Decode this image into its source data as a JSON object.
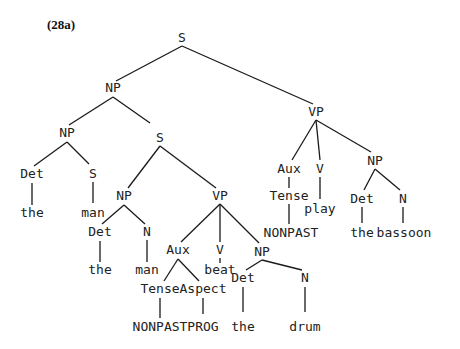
{
  "example_number": "(28a)",
  "tree": {
    "nodes": [
      {
        "id": "s_root",
        "label": "S",
        "x": 182,
        "y": 38
      },
      {
        "id": "np_subj",
        "label": "NP",
        "x": 113,
        "y": 88
      },
      {
        "id": "np_inner",
        "label": "NP",
        "x": 67,
        "y": 133
      },
      {
        "id": "det_1",
        "label": "Det",
        "x": 32,
        "y": 174
      },
      {
        "id": "s_rel_empty",
        "label": "S",
        "x": 93,
        "y": 174
      },
      {
        "id": "word_the_1",
        "label": "the",
        "x": 32,
        "y": 213
      },
      {
        "id": "word_man_1",
        "label": "man",
        "x": 93,
        "y": 213
      },
      {
        "id": "s_rel",
        "label": "S",
        "x": 160,
        "y": 138
      },
      {
        "id": "np_rel",
        "label": "NP",
        "x": 124,
        "y": 196
      },
      {
        "id": "det_2",
        "label": "Det",
        "x": 100,
        "y": 232
      },
      {
        "id": "n_2",
        "label": "N",
        "x": 147,
        "y": 232
      },
      {
        "id": "word_the_2",
        "label": "the",
        "x": 100,
        "y": 270
      },
      {
        "id": "word_man_2",
        "label": "man",
        "x": 147,
        "y": 270
      },
      {
        "id": "vp_rel",
        "label": "VP",
        "x": 220,
        "y": 196
      },
      {
        "id": "aux_rel",
        "label": "Aux",
        "x": 178,
        "y": 250
      },
      {
        "id": "v_rel",
        "label": "V",
        "x": 220,
        "y": 250
      },
      {
        "id": "np_obj_rel",
        "label": "NP",
        "x": 262,
        "y": 252
      },
      {
        "id": "tense_rel",
        "label": "Tense",
        "x": 160,
        "y": 289
      },
      {
        "id": "aspect_rel",
        "label": "Aspect",
        "x": 203,
        "y": 289
      },
      {
        "id": "word_beat",
        "label": "beat",
        "x": 220,
        "y": 270
      },
      {
        "id": "word_nonpast_rel",
        "label": "NONPAST",
        "x": 160,
        "y": 327
      },
      {
        "id": "word_prog",
        "label": "PROG",
        "x": 203,
        "y": 327
      },
      {
        "id": "det_3",
        "label": "Det",
        "x": 243,
        "y": 278
      },
      {
        "id": "n_3",
        "label": "N",
        "x": 305,
        "y": 278
      },
      {
        "id": "word_the_3",
        "label": "the",
        "x": 243,
        "y": 327
      },
      {
        "id": "word_drum",
        "label": "drum",
        "x": 305,
        "y": 327
      },
      {
        "id": "vp_main",
        "label": "VP",
        "x": 316,
        "y": 112
      },
      {
        "id": "aux_main",
        "label": "Aux",
        "x": 289,
        "y": 169
      },
      {
        "id": "v_main",
        "label": "V",
        "x": 320,
        "y": 169
      },
      {
        "id": "np_obj_main",
        "label": "NP",
        "x": 375,
        "y": 161
      },
      {
        "id": "tense_main",
        "label": "Tense",
        "x": 289,
        "y": 196
      },
      {
        "id": "word_play",
        "label": "play",
        "x": 320,
        "y": 209
      },
      {
        "id": "word_nonpast_main",
        "label": "NONPAST",
        "x": 291,
        "y": 233
      },
      {
        "id": "det_4",
        "label": "Det",
        "x": 362,
        "y": 199
      },
      {
        "id": "n_4",
        "label": "N",
        "x": 403,
        "y": 199
      },
      {
        "id": "word_the_4",
        "label": "the",
        "x": 362,
        "y": 233
      },
      {
        "id": "word_bassoon",
        "label": "bassoon",
        "x": 404,
        "y": 233
      }
    ],
    "edges": [
      {
        "from": [
          182,
          46
        ],
        "to": [
          116,
          81
        ]
      },
      {
        "from": [
          182,
          46
        ],
        "to": [
          313,
          104
        ]
      },
      {
        "from": [
          113,
          97
        ],
        "to": [
          69,
          125
        ]
      },
      {
        "from": [
          113,
          97
        ],
        "to": [
          150,
          123
        ]
      },
      {
        "from": [
          67,
          142
        ],
        "to": [
          34,
          166
        ]
      },
      {
        "from": [
          67,
          142
        ],
        "to": [
          89,
          164
        ]
      },
      {
        "from": [
          32,
          183
        ],
        "to": [
          32,
          205
        ]
      },
      {
        "from": [
          93,
          182
        ],
        "to": [
          93,
          203
        ]
      },
      {
        "from": [
          160,
          146
        ],
        "to": [
          128,
          188
        ]
      },
      {
        "from": [
          160,
          146
        ],
        "to": [
          216,
          188
        ]
      },
      {
        "from": [
          124,
          205
        ],
        "to": [
          102,
          224
        ]
      },
      {
        "from": [
          124,
          205
        ],
        "to": [
          145,
          224
        ]
      },
      {
        "from": [
          100,
          241
        ],
        "to": [
          100,
          262
        ]
      },
      {
        "from": [
          147,
          240
        ],
        "to": [
          147,
          262
        ]
      },
      {
        "from": [
          220,
          204
        ],
        "to": [
          181,
          242
        ]
      },
      {
        "from": [
          220,
          204
        ],
        "to": [
          220,
          242
        ]
      },
      {
        "from": [
          220,
          204
        ],
        "to": [
          259,
          243
        ]
      },
      {
        "from": [
          220,
          258
        ],
        "to": [
          220,
          263
        ]
      },
      {
        "from": [
          178,
          259
        ],
        "to": [
          164,
          281
        ]
      },
      {
        "from": [
          178,
          259
        ],
        "to": [
          199,
          281
        ]
      },
      {
        "from": [
          160,
          298
        ],
        "to": [
          160,
          318
        ]
      },
      {
        "from": [
          203,
          298
        ],
        "to": [
          203,
          314
        ]
      },
      {
        "from": [
          262,
          260
        ],
        "to": [
          246,
          270
        ]
      },
      {
        "from": [
          262,
          260
        ],
        "to": [
          302,
          270
        ]
      },
      {
        "from": [
          243,
          287
        ],
        "to": [
          243,
          312
        ]
      },
      {
        "from": [
          305,
          287
        ],
        "to": [
          305,
          312
        ]
      },
      {
        "from": [
          316,
          120
        ],
        "to": [
          292,
          160
        ]
      },
      {
        "from": [
          316,
          120
        ],
        "to": [
          320,
          160
        ]
      },
      {
        "from": [
          316,
          120
        ],
        "to": [
          371,
          152
        ]
      },
      {
        "from": [
          289,
          177
        ],
        "to": [
          289,
          188
        ]
      },
      {
        "from": [
          289,
          204
        ],
        "to": [
          289,
          224
        ]
      },
      {
        "from": [
          320,
          177
        ],
        "to": [
          320,
          199
        ]
      },
      {
        "from": [
          375,
          169
        ],
        "to": [
          364,
          190
        ]
      },
      {
        "from": [
          375,
          169
        ],
        "to": [
          400,
          190
        ]
      },
      {
        "from": [
          362,
          207
        ],
        "to": [
          362,
          223
        ]
      },
      {
        "from": [
          403,
          207
        ],
        "to": [
          403,
          223
        ]
      }
    ]
  }
}
